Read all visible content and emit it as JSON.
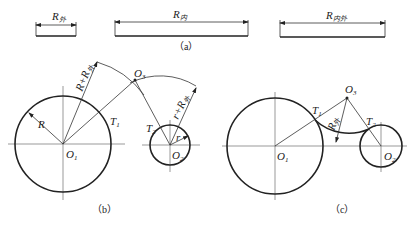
{
  "figure_a": {
    "caption": "（a）",
    "bars": [
      {
        "label": "R",
        "subscript": "外"
      },
      {
        "label": "R",
        "subscript": "内"
      },
      {
        "label": "R",
        "subscript": "内外"
      }
    ]
  },
  "figure_b": {
    "caption": "（b）",
    "labels": {
      "o1": "O",
      "o1_sub": "1",
      "o2": "O",
      "o2_sub": "2",
      "o3": "O",
      "o3_sub": "3",
      "t1": "T",
      "t1_sub": "1",
      "t2": "T",
      "t2_sub": "2",
      "big_radius": "R",
      "small_radius": "r",
      "outer_sum1": "R+R",
      "outer_sum1_sub": "外",
      "outer_sum2": "r+R",
      "outer_sum2_sub": "外"
    }
  },
  "figure_c": {
    "caption": "（c）",
    "labels": {
      "o1": "O",
      "o1_sub": "1",
      "o2": "O",
      "o2_sub": "2",
      "o3": "O",
      "o3_sub": "3",
      "t1": "T",
      "t1_sub": "1",
      "t2": "T",
      "t2_sub": "2",
      "arc_radius": "R",
      "arc_radius_sub": "外"
    }
  }
}
